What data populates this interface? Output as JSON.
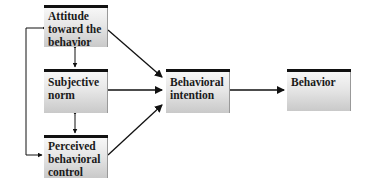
{
  "diagram": {
    "type": "theory_of_planned_behavior",
    "nodes": [
      {
        "id": "attitude",
        "label": "Attitude toward the behavior"
      },
      {
        "id": "subjective_norm",
        "label": "Subjective norm"
      },
      {
        "id": "perceived_control",
        "label": "Perceived behavioral control"
      },
      {
        "id": "intention",
        "label": "Behavioral intention"
      },
      {
        "id": "behavior",
        "label": "Behavior"
      }
    ],
    "edges": [
      {
        "from": "attitude",
        "to": "intention"
      },
      {
        "from": "subjective_norm",
        "to": "intention"
      },
      {
        "from": "perceived_control",
        "to": "intention"
      },
      {
        "from": "intention",
        "to": "behavior"
      },
      {
        "from": "attitude",
        "to": "subjective_norm",
        "bidirectional": true
      },
      {
        "from": "subjective_norm",
        "to": "perceived_control",
        "bidirectional": true
      },
      {
        "from": "attitude",
        "to": "perceived_control",
        "bidirectional": true
      }
    ]
  },
  "labels": {
    "attitude_l1": "Attitude",
    "attitude_l2": "toward the",
    "attitude_l3": "behavior",
    "norm_l1": "Subjective",
    "norm_l2": "norm",
    "control_l1": "Perceived",
    "control_l2": "behavioral",
    "control_l3": "control",
    "intention_l1": "Behavioral",
    "intention_l2": "intention",
    "behavior_l1": "Behavior"
  }
}
